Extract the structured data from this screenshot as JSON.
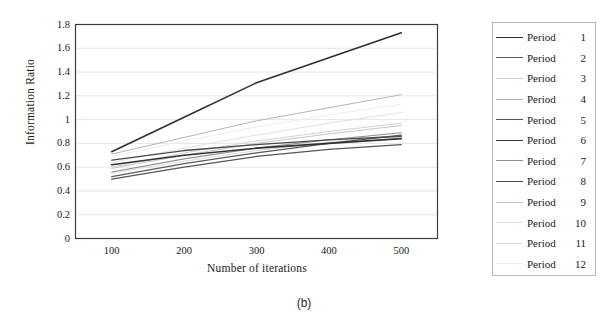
{
  "caption": "(b)",
  "chart_data": {
    "type": "line",
    "title": "",
    "xlabel": "Number of iterations",
    "ylabel": "Information Ratio",
    "x": [
      100,
      200,
      300,
      400,
      500
    ],
    "xlim": [
      50,
      550
    ],
    "ylim": [
      0,
      1.8
    ],
    "xticks": [
      "100",
      "200",
      "300",
      "400",
      "500"
    ],
    "yticks": [
      "0",
      "0.2",
      "0.4",
      "0.6",
      "0.8",
      "1",
      "1.2",
      "1.4",
      "1.6",
      "1.8"
    ],
    "grid": "horizontal",
    "legend_position": "right",
    "series": [
      {
        "name": "Period",
        "number": "1",
        "label": "Period 1",
        "color": "#2e2e2e",
        "width": 1.5,
        "values": [
          0.73,
          1.02,
          1.31,
          1.52,
          1.73
        ]
      },
      {
        "name": "Period",
        "number": "2",
        "label": "Period 2",
        "color": "#5a5a5a",
        "width": 1.2,
        "values": [
          0.52,
          0.63,
          0.72,
          0.8,
          0.87
        ]
      },
      {
        "name": "Period",
        "number": "3",
        "label": "Period 3",
        "color": "#d2d2d2",
        "width": 1.0,
        "values": [
          0.6,
          0.72,
          0.82,
          0.9,
          0.97
        ]
      },
      {
        "name": "Period",
        "number": "4",
        "label": "Period 4",
        "color": "#b4b4b4",
        "width": 1.0,
        "values": [
          0.71,
          0.85,
          0.99,
          1.1,
          1.21
        ]
      },
      {
        "name": "Period",
        "number": "5",
        "label": "Period 5",
        "color": "#565656",
        "width": 1.3,
        "values": [
          0.5,
          0.6,
          0.69,
          0.75,
          0.79
        ]
      },
      {
        "name": "Period",
        "number": "6",
        "label": "Period 6",
        "color": "#333333",
        "width": 1.6,
        "values": [
          0.62,
          0.7,
          0.76,
          0.8,
          0.84
        ]
      },
      {
        "name": "Period",
        "number": "7",
        "label": "Period 7",
        "color": "#8e8e8e",
        "width": 1.1,
        "values": [
          0.56,
          0.67,
          0.76,
          0.83,
          0.89
        ]
      },
      {
        "name": "Period",
        "number": "8",
        "label": "Period 8",
        "color": "#4a4a4a",
        "width": 1.3,
        "values": [
          0.66,
          0.74,
          0.79,
          0.83,
          0.86
        ]
      },
      {
        "name": "Period",
        "number": "9",
        "label": "Period 9",
        "color": "#c6c6c6",
        "width": 1.0,
        "values": [
          0.59,
          0.7,
          0.8,
          0.88,
          0.95
        ]
      },
      {
        "name": "Period",
        "number": "10",
        "label": "Period 10",
        "color": "#e2e2e2",
        "width": 1.0,
        "values": [
          0.64,
          0.76,
          0.87,
          0.97,
          1.06
        ]
      },
      {
        "name": "Period",
        "number": "11",
        "label": "Period 11",
        "color": "#dcdcdc",
        "width": 1.0,
        "values": [
          0.55,
          0.65,
          0.74,
          0.81,
          0.86
        ]
      },
      {
        "name": "Period",
        "number": "12",
        "label": "Period 12",
        "color": "#ededed",
        "width": 1.0,
        "values": [
          0.69,
          0.82,
          0.94,
          1.04,
          1.13
        ]
      }
    ]
  },
  "legend": {
    "items": [
      {
        "label": "Period",
        "number": "1"
      },
      {
        "label": "Period",
        "number": "2"
      },
      {
        "label": "Period",
        "number": "3"
      },
      {
        "label": "Period",
        "number": "4"
      },
      {
        "label": "Period",
        "number": "5"
      },
      {
        "label": "Period",
        "number": "6"
      },
      {
        "label": "Period",
        "number": "7"
      },
      {
        "label": "Period",
        "number": "8"
      },
      {
        "label": "Period",
        "number": "9"
      },
      {
        "label": "Period",
        "number": "10"
      },
      {
        "label": "Period",
        "number": "11"
      },
      {
        "label": "Period",
        "number": "12"
      }
    ]
  }
}
